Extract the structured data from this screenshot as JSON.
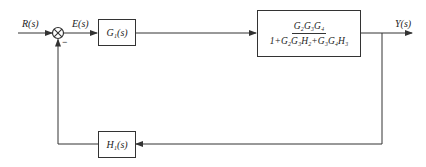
{
  "diagram": {
    "type": "control-system-block-diagram",
    "signals": {
      "input": "R(s)",
      "error": "E(s)",
      "output": "Y(s)"
    },
    "summing_junction": {
      "sign_feedback": "−"
    },
    "blocks": {
      "forward1": "G₁(s)",
      "forward2": {
        "numerator": "G₂G₃G₄",
        "denominator": "1+G₂G₃H₂+G₃G₄H₃"
      },
      "feedback": "H₁(s)"
    },
    "colors": {
      "line": "#333333",
      "background": "#ffffff"
    }
  }
}
